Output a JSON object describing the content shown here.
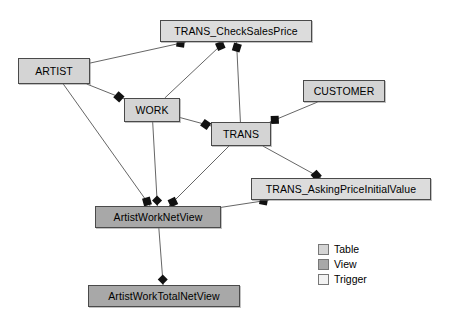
{
  "diagram": {
    "background_color": "#ffffff",
    "nodes": [
      {
        "id": "artist",
        "label": "ARTIST",
        "kind": "table",
        "x": 18,
        "y": 58,
        "w": 72,
        "h": 26
      },
      {
        "id": "work",
        "label": "WORK",
        "kind": "table",
        "x": 124,
        "y": 98,
        "w": 56,
        "h": 24
      },
      {
        "id": "trans",
        "label": "TRANS",
        "kind": "table",
        "x": 211,
        "y": 122,
        "w": 60,
        "h": 24
      },
      {
        "id": "customer",
        "label": "CUSTOMER",
        "kind": "table",
        "x": 303,
        "y": 80,
        "w": 82,
        "h": 22
      },
      {
        "id": "check_sales_price",
        "label": "TRANS_CheckSalesPrice",
        "kind": "trigger",
        "x": 160,
        "y": 20,
        "w": 152,
        "h": 22
      },
      {
        "id": "asking_price",
        "label": "TRANS_AskingPriceInitialValue",
        "kind": "trigger",
        "x": 251,
        "y": 178,
        "w": 180,
        "h": 22
      },
      {
        "id": "artist_work_net",
        "label": "ArtistWorkNetView",
        "kind": "view",
        "x": 95,
        "y": 206,
        "w": 126,
        "h": 22
      },
      {
        "id": "artist_work_total",
        "label": "ArtistWorkTotalNetView",
        "kind": "view",
        "x": 88,
        "y": 285,
        "w": 152,
        "h": 22
      }
    ],
    "edges": [
      {
        "from": "artist",
        "to": "check_sales_price",
        "marker_at": "to",
        "marker": "square"
      },
      {
        "from": "artist",
        "to": "work",
        "marker_at": "to",
        "marker": "square"
      },
      {
        "from": "artist",
        "to": "artist_work_net",
        "marker_at": "to",
        "marker": "square"
      },
      {
        "from": "work",
        "to": "check_sales_price",
        "marker_at": "to",
        "marker": "square"
      },
      {
        "from": "work",
        "to": "trans",
        "marker_at": "to",
        "marker": "square"
      },
      {
        "from": "work",
        "to": "artist_work_net",
        "marker_at": "to",
        "marker": "diamond"
      },
      {
        "from": "trans",
        "to": "check_sales_price",
        "marker_at": "to",
        "marker": "square"
      },
      {
        "from": "trans",
        "to": "artist_work_net",
        "marker_at": "to",
        "marker": "square"
      },
      {
        "from": "trans",
        "to": "asking_price",
        "marker_at": "to",
        "marker": "square"
      },
      {
        "from": "customer",
        "to": "trans",
        "marker_at": "to",
        "marker": "square"
      },
      {
        "from": "asking_price",
        "to": "artist_work_net",
        "marker_at": "from",
        "marker": "square"
      },
      {
        "from": "artist_work_net",
        "to": "artist_work_total",
        "marker_at": "to",
        "marker": "diamond"
      }
    ],
    "marker_color": "#111111",
    "edge_color": "#666666"
  },
  "legend": {
    "x": 318,
    "y": 243,
    "items": [
      {
        "key": "table",
        "label": "Table",
        "color": "#d4d4d4"
      },
      {
        "key": "view",
        "label": "View",
        "color": "#a8a8a8"
      },
      {
        "key": "trigger",
        "label": "Trigger",
        "color": "#f2f2f2"
      }
    ]
  }
}
